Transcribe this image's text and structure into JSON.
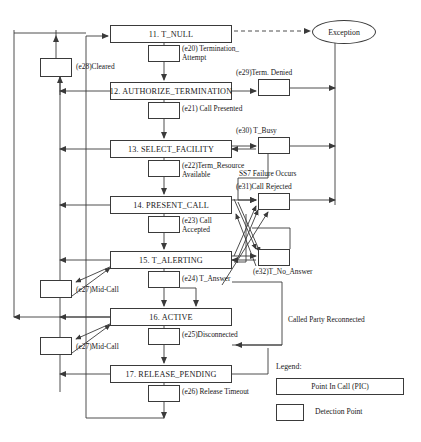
{
  "diagram": {
    "pics": [
      {
        "id": "t-null",
        "label": "11. T_NULL",
        "x": 110,
        "y": 25,
        "w": 122,
        "h": 18
      },
      {
        "id": "authorize-termination",
        "label": "12. AUTHORIZE_TERMINATION",
        "x": 110,
        "y": 82,
        "w": 122,
        "h": 18
      },
      {
        "id": "select-facility",
        "label": "13. SELECT_FACILITY",
        "x": 110,
        "y": 140,
        "w": 122,
        "h": 18
      },
      {
        "id": "present-call",
        "label": "14. PRESENT_CALL",
        "x": 110,
        "y": 196,
        "w": 122,
        "h": 18
      },
      {
        "id": "t-alerting",
        "label": "15. T_ALERTING",
        "x": 110,
        "y": 251,
        "w": 122,
        "h": 18
      },
      {
        "id": "active",
        "label": "16. ACTIVE",
        "x": 110,
        "y": 308,
        "w": 122,
        "h": 18
      },
      {
        "id": "release-pending",
        "label": "17. RELEASE_PENDING",
        "x": 110,
        "y": 365,
        "w": 122,
        "h": 18
      }
    ],
    "detection_points": [
      {
        "id": "dp-e20-termination-attempt",
        "x": 148,
        "y": 45,
        "w": 32,
        "h": 17
      },
      {
        "id": "dp-e28-cleared",
        "x": 40,
        "y": 58,
        "w": 32,
        "h": 19
      },
      {
        "id": "dp-e29-term-denied",
        "x": 258,
        "y": 79,
        "w": 32,
        "h": 17
      },
      {
        "id": "dp-e21-call-presented",
        "x": 148,
        "y": 102,
        "w": 32,
        "h": 17
      },
      {
        "id": "dp-e30-t-busy",
        "x": 258,
        "y": 137,
        "w": 32,
        "h": 17
      },
      {
        "id": "dp-e22-term-resource",
        "x": 148,
        "y": 160,
        "w": 32,
        "h": 17
      },
      {
        "id": "dp-e31-call-rejected",
        "x": 258,
        "y": 193,
        "w": 32,
        "h": 17
      },
      {
        "id": "dp-e23-call-accepted",
        "x": 148,
        "y": 216,
        "w": 32,
        "h": 17
      },
      {
        "id": "dp-e32-t-no-answer",
        "x": 258,
        "y": 249,
        "w": 32,
        "h": 17
      },
      {
        "id": "dp-e24-t-answer",
        "x": 148,
        "y": 271,
        "w": 32,
        "h": 17
      },
      {
        "id": "dp-e27-mid-call-alerting",
        "x": 40,
        "y": 280,
        "w": 32,
        "h": 18
      },
      {
        "id": "dp-e25-disconnected",
        "x": 148,
        "y": 328,
        "w": 32,
        "h": 17
      },
      {
        "id": "dp-e27-mid-call-active",
        "x": 40,
        "y": 337,
        "w": 32,
        "h": 18
      },
      {
        "id": "dp-e26-release-timeout",
        "x": 148,
        "y": 385,
        "w": 32,
        "h": 17
      }
    ],
    "exception": {
      "label": "Exception",
      "x": 312,
      "y": 20,
      "w": 62,
      "h": 22
    },
    "event_labels": [
      {
        "id": "e20",
        "text": "(e20) Termination_\nAttempt",
        "x": 182,
        "y": 44
      },
      {
        "id": "e28",
        "text": "(e28)Cleared",
        "x": 76,
        "y": 62
      },
      {
        "id": "e29",
        "text": "(e29)Term. Denied",
        "x": 236,
        "y": 68
      },
      {
        "id": "e21",
        "text": "(e21) Call Presented",
        "x": 182,
        "y": 104
      },
      {
        "id": "e30",
        "text": "(e30) T_Busy",
        "x": 236,
        "y": 126
      },
      {
        "id": "e22",
        "text": "(e22)Term_Resource\nAvailable",
        "x": 182,
        "y": 161
      },
      {
        "id": "ss7",
        "text": "SS7 Failure Occurs",
        "x": 239,
        "y": 169
      },
      {
        "id": "e31",
        "text": "(e31)Call Rejected",
        "x": 236,
        "y": 182
      },
      {
        "id": "e23",
        "text": "(e23) Call\nAccepted",
        "x": 182,
        "y": 216
      },
      {
        "id": "e32",
        "text": "(e32)T_No_Answer",
        "x": 253,
        "y": 267
      },
      {
        "id": "e24",
        "text": "(e24) T_Answer",
        "x": 182,
        "y": 274
      },
      {
        "id": "e27a",
        "text": "(e27)Mid-Call",
        "x": 76,
        "y": 285
      },
      {
        "id": "e25",
        "text": "(e25)Disconnected",
        "x": 182,
        "y": 330
      },
      {
        "id": "e27b",
        "text": "(e27)Mid-Call",
        "x": 76,
        "y": 342
      },
      {
        "id": "reconnect",
        "text": "Called Party Reconnected",
        "x": 288,
        "y": 315
      },
      {
        "id": "e26",
        "text": "(e26) Release Timeout",
        "x": 182,
        "y": 387
      }
    ],
    "legend": {
      "title": "Legend:",
      "pic_label": "Point In Call (PIC)",
      "dp_label": "Detection Point",
      "title_x": 276,
      "title_y": 366,
      "pic_x": 276,
      "pic_y": 378,
      "pic_w": 128,
      "pic_h": 17,
      "dp_x": 276,
      "dp_y": 404,
      "dp_w": 28,
      "dp_h": 17,
      "dp_label_x": 315,
      "dp_label_y": 409
    }
  }
}
